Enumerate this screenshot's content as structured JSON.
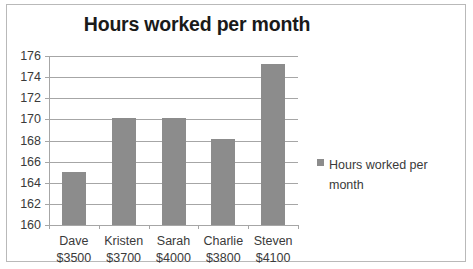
{
  "chart_data": {
    "type": "bar",
    "title": "Hours worked per month",
    "xlabel": "",
    "ylabel": "",
    "categories": [
      "Dave",
      "Kristen",
      "Sarah",
      "Charlie",
      "Steven"
    ],
    "category_sublabels": [
      "$3500",
      "$3700",
      "$4000",
      "$3800",
      "$4100"
    ],
    "values": [
      165,
      170.1,
      170.1,
      168.1,
      175.2
    ],
    "series": [
      {
        "name": "Hours worked per month",
        "values": [
          165,
          170.1,
          170.1,
          168.1,
          175.2
        ],
        "color": "#8c8c8c"
      }
    ],
    "ylim": [
      160,
      176
    ],
    "ytick_labels": [
      "176",
      "174",
      "172",
      "170",
      "168",
      "166",
      "164",
      "162",
      "160"
    ],
    "ytick_values": [
      176,
      174,
      172,
      170,
      168,
      166,
      164,
      162,
      160
    ],
    "grid": true,
    "legend": [
      "Hours worked per month"
    ],
    "legend_position": "right",
    "bar_color": "#8c8c8c",
    "axis_color": "#a6a6a6",
    "text_color": "#3a3a3a",
    "background": "#ffffff",
    "border_color": "#b9b9b9"
  },
  "legend": {
    "entry_label": "Hours worked per month",
    "marker_name": "legend-swatch"
  }
}
